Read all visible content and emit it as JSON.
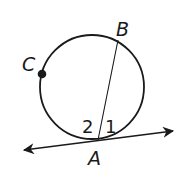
{
  "diagram": {
    "type": "geometry",
    "stroke_color": "#1a1a1a",
    "points": {
      "A": {
        "label": "A"
      },
      "B": {
        "label": "B"
      },
      "C": {
        "label": "C"
      }
    },
    "angles": {
      "angle1": {
        "label": "1"
      },
      "angle2": {
        "label": "2"
      }
    }
  }
}
